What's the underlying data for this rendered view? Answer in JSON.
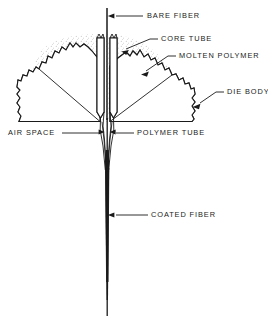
{
  "figure": {
    "background_color": "#ffffff",
    "ink_color": "#1a1a1a",
    "width": 268,
    "height": 322
  },
  "labels": {
    "bare_fiber": "BARE FIBER",
    "core_tube": "CORE TUBE",
    "molten_polymer": "MOLTEN POLYMER",
    "die_body": "DIE BODY",
    "air_space": "AIR  SPACE",
    "polymer_tube": "POLYMER  TUBE",
    "coated_fiber": "COATED FIBER"
  },
  "parts": [
    {
      "id": "bare-fiber",
      "label": "BARE FIBER",
      "description": "Vertical fiber entering the die from the top",
      "callout_side": "right"
    },
    {
      "id": "core-tube",
      "label": "CORE TUBE",
      "description": "Inner conical tube guiding the bare fiber",
      "callout_side": "right"
    },
    {
      "id": "molten-polymer",
      "label": "MOLTEN POLYMER",
      "description": "Stippled region of melt between core tube and die body",
      "callout_side": "right"
    },
    {
      "id": "die-body",
      "label": "DIE BODY",
      "description": "Cross-hatched sectioned die body with broken edges",
      "callout_side": "right"
    },
    {
      "id": "air-space",
      "label": "AIR  SPACE",
      "description": "Annular gap at the die exit",
      "callout_side": "left"
    },
    {
      "id": "polymer-tube",
      "label": "POLYMER  TUBE",
      "description": "Tube of polymer drawn down onto the fiber",
      "callout_side": "right"
    },
    {
      "id": "coated-fiber",
      "label": "COATED FIBER",
      "description": "Fiber emerging from the die with the applied coating",
      "callout_side": "right"
    }
  ]
}
